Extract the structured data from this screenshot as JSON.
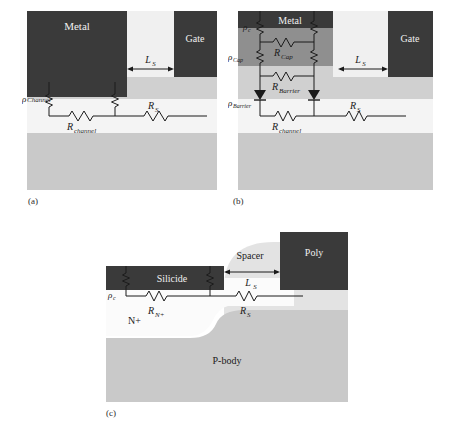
{
  "figure": {
    "panels": [
      {
        "id": "a",
        "caption": "(a)",
        "regions": [
          {
            "name": "metal-block",
            "label": "Metal",
            "color": "#3a3a3a"
          },
          {
            "name": "gate-block",
            "label": "Gate",
            "color": "#3a3a3a"
          },
          {
            "name": "upper-layer",
            "color": "#d0d0d0"
          },
          {
            "name": "channel-layer",
            "color": "#f2f2f2"
          },
          {
            "name": "substrate-layer",
            "color": "#c9c9c9"
          }
        ],
        "labels": {
          "metal": "Metal",
          "gate": "Gate",
          "ls": "L",
          "ls_sub": "S",
          "rho_channel": "ρ",
          "rho_channel_sub": "Channel",
          "r_channel": "R",
          "r_channel_sub": "channel",
          "r_s": "R",
          "r_s_sub": "S"
        }
      },
      {
        "id": "b",
        "caption": "(b)",
        "regions": [
          {
            "name": "metal-block",
            "label": "Metal",
            "color": "#3a3a3a"
          },
          {
            "name": "gate-block",
            "label": "Gate",
            "color": "#3a3a3a"
          },
          {
            "name": "cap-layer",
            "color": "#8f8f8f"
          },
          {
            "name": "barrier-layer",
            "color": "#d0d0d0"
          },
          {
            "name": "channel-layer",
            "color": "#f2f2f2"
          },
          {
            "name": "substrate-layer",
            "color": "#c9c9c9"
          }
        ],
        "labels": {
          "metal": "Metal",
          "gate": "Gate",
          "ls": "L",
          "ls_sub": "S",
          "rho_c": "ρ",
          "rho_c_sub": "c",
          "rho_cap": "ρ",
          "rho_cap_sub": "Cap",
          "rho_barrier": "ρ",
          "rho_barrier_sub": "Barrier",
          "r_cap": "R",
          "r_cap_sub": "Cap",
          "r_barrier": "R",
          "r_barrier_sub": "Barrier",
          "r_channel": "R",
          "r_channel_sub": "channel",
          "r_s": "R",
          "r_s_sub": "S"
        }
      },
      {
        "id": "c",
        "caption": "(c)",
        "regions": [
          {
            "name": "silicide-block",
            "label": "Silicide",
            "color": "#3a3a3a"
          },
          {
            "name": "poly-block",
            "label": "Poly",
            "color": "#3a3a3a"
          },
          {
            "name": "spacer-region",
            "label": "Spacer",
            "color": "#e0e0e0"
          },
          {
            "name": "nplus-region",
            "label": "N+",
            "color": "#fbfbfb"
          },
          {
            "name": "pbody-region",
            "label": "P-body",
            "color": "#c9c9c9"
          }
        ],
        "labels": {
          "silicide": "Silicide",
          "poly": "Poly",
          "spacer": "Spacer",
          "nplus": "N+",
          "pbody": "P-body",
          "ls": "L",
          "ls_sub": "S",
          "rho_c": "ρ",
          "rho_c_sub": "c",
          "r_nplus": "R",
          "r_nplus_sub": "N+",
          "r_s": "R",
          "r_s_sub": "S"
        }
      }
    ]
  }
}
